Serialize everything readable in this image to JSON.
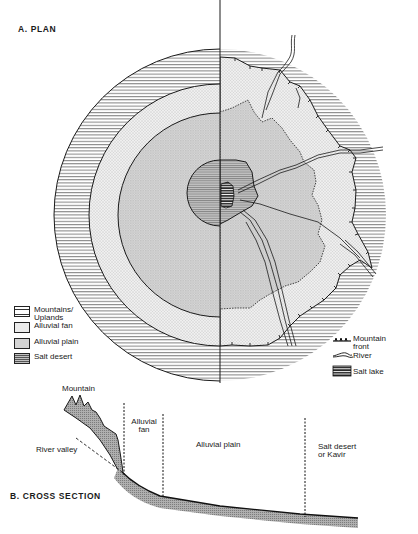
{
  "figure": {
    "plan_title": "A. PLAN",
    "cross_section_title": "B. CROSS SECTION"
  },
  "legend_left": {
    "items": [
      {
        "key": "mountains",
        "label_line1": "Mountains/",
        "label_line2": "Uplands",
        "pattern": "horizontal-lines"
      },
      {
        "key": "alluvial_fan",
        "label_line1": "Alluvial fan",
        "pattern": "light-stipple"
      },
      {
        "key": "alluvial_plain",
        "label_line1": "Alluvial plain",
        "pattern": "medium-stipple"
      },
      {
        "key": "salt_desert",
        "label_line1": "Salt desert",
        "pattern": "dark-lines"
      }
    ]
  },
  "legend_right": {
    "items": [
      {
        "key": "mountain_front",
        "label_line1": "Mountain",
        "label_line2": "front",
        "symbol": "ticked-line"
      },
      {
        "key": "river",
        "label_line1": "River",
        "symbol": "braided-line"
      },
      {
        "key": "salt_lake",
        "label_line1": "Salt lake",
        "symbol": "dense-horizontal-lines"
      }
    ]
  },
  "cross_section": {
    "labels": {
      "mountain": "Mountain",
      "river_valley": "River valley",
      "alluvial_fan_1": "Alluvial",
      "alluvial_fan_2": "fan",
      "alluvial_plain": "Alluvial plain",
      "salt_desert_1": "Salt desert",
      "salt_desert_2": "or Kavir"
    }
  },
  "colors": {
    "ink": "#1a1a1a",
    "fan_fill": "#ececec",
    "plain_fill": "#d4d4d4",
    "desert_fill": "#bdbdbd",
    "section_fill": "#a8a8a8"
  }
}
